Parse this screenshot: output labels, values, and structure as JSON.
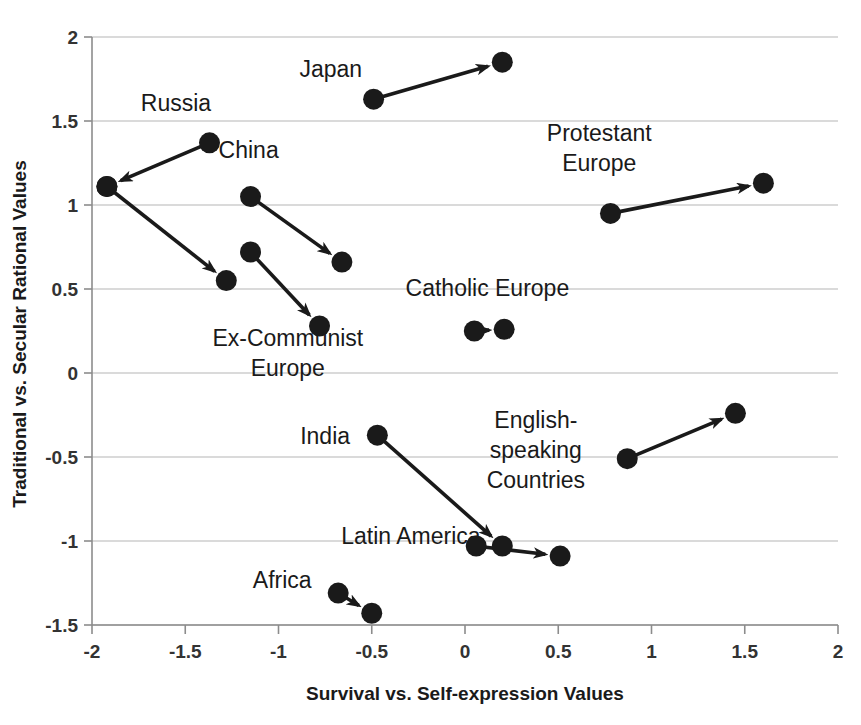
{
  "chart_data": {
    "type": "scatter",
    "title": "",
    "xlabel": "Survival vs. Self-expression Values",
    "ylabel": "Traditional vs. Secular Rational Values",
    "xlim": [
      -2,
      2
    ],
    "ylim": [
      -1.5,
      2
    ],
    "xticks": [
      "-2",
      "-1.5",
      "-1",
      "-0.5",
      "0",
      "0.5",
      "1",
      "1.5",
      "2"
    ],
    "xtick_values": [
      -2,
      -1.5,
      -1,
      -0.5,
      0,
      0.5,
      1,
      1.5,
      2
    ],
    "yticks": [
      "2",
      "1.5",
      "1",
      "0.5",
      "0",
      "-0.5",
      "-1",
      "-1.5"
    ],
    "ytick_values": [
      2,
      1.5,
      1,
      0.5,
      0,
      -0.5,
      -1,
      -1.5
    ],
    "grid": true,
    "legend": "none",
    "marker_color": "#1a1a1a",
    "grid_color": "#b5b5b5",
    "axis_color": "#8c8c8c",
    "series": [
      {
        "name": "Russia",
        "label": "Russia",
        "label_x": -1.55,
        "label_y": 1.56,
        "start": [
          -1.37,
          1.37
        ],
        "end": [
          -1.92,
          1.11
        ],
        "arrow": true
      },
      {
        "name": "Ex-Communist Europe A",
        "label": "",
        "label_x": null,
        "label_y": null,
        "start": [
          -1.92,
          1.11
        ],
        "end": [
          -1.28,
          0.55
        ],
        "arrow": true
      },
      {
        "name": "Ex-Communist Europe B",
        "label": "Ex-Communist\nEurope",
        "label_x": -0.95,
        "label_y": 0.16,
        "start": [
          -1.15,
          0.72
        ],
        "end": [
          -0.78,
          0.28
        ],
        "arrow": true
      },
      {
        "name": "China",
        "label": "China",
        "label_x": -1.16,
        "label_y": 1.28,
        "start": [
          -1.15,
          1.05
        ],
        "end": [
          -0.66,
          0.66
        ],
        "arrow": true
      },
      {
        "name": "Japan",
        "label": "Japan",
        "label_x": -0.72,
        "label_y": 1.76,
        "start": [
          -0.49,
          1.63
        ],
        "end": [
          0.2,
          1.85
        ],
        "arrow": true
      },
      {
        "name": "Protestant Europe",
        "label": "Protestant\nEurope",
        "label_x": 0.72,
        "label_y": 1.38,
        "start": [
          0.78,
          0.95
        ],
        "end": [
          1.6,
          1.13
        ],
        "arrow": true
      },
      {
        "name": "Catholic Europe",
        "label": "Catholic Europe",
        "label_x": 0.12,
        "label_y": 0.46,
        "start": [
          0.05,
          0.25
        ],
        "end": [
          0.21,
          0.26
        ],
        "arrow": true
      },
      {
        "name": "India",
        "label": "India",
        "label_x": -0.75,
        "label_y": -0.42,
        "start": [
          -0.47,
          -0.37
        ],
        "end": [
          0.2,
          -1.03
        ],
        "arrow": true
      },
      {
        "name": "Latin America",
        "label": "Latin America",
        "label_x": -0.29,
        "label_y": -1.02,
        "start": [
          0.06,
          -1.03
        ],
        "end": [
          0.51,
          -1.09
        ],
        "arrow": true
      },
      {
        "name": "English-speaking Countries",
        "label": "English-\nspeaking\nCountries",
        "label_x": 0.38,
        "label_y": -0.33,
        "start": [
          0.87,
          -0.51
        ],
        "end": [
          1.45,
          -0.24
        ],
        "arrow": true
      },
      {
        "name": "Africa",
        "label": "Africa",
        "label_x": -0.98,
        "label_y": -1.28,
        "start": [
          -0.68,
          -1.31
        ],
        "end": [
          -0.5,
          -1.43
        ],
        "arrow": true
      }
    ]
  }
}
